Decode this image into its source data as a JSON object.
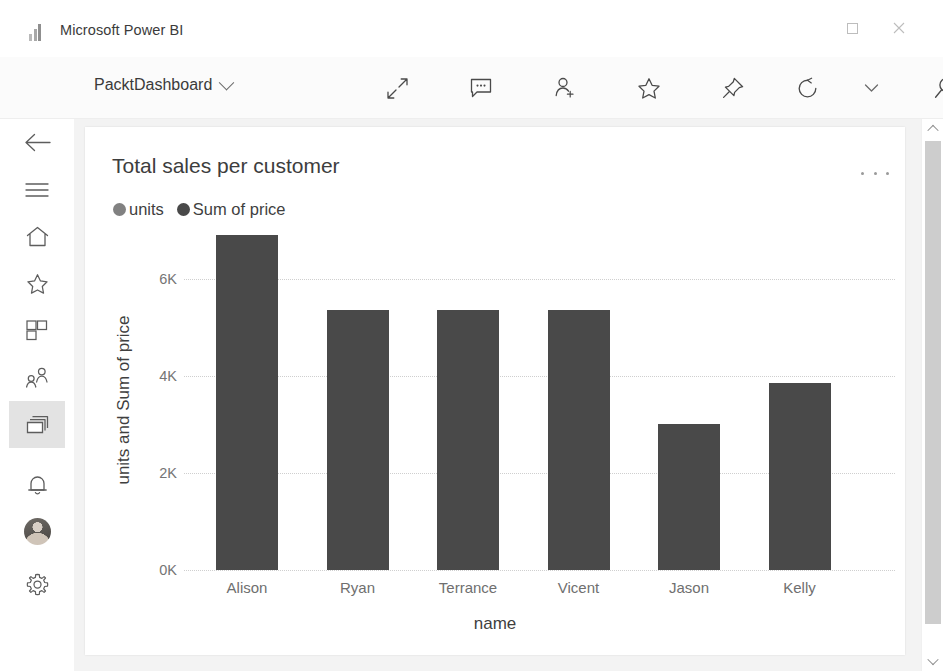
{
  "window": {
    "app_title": "Microsoft Power BI",
    "logo_icon": "power-bi-bars-icon",
    "controls": {
      "minimize": "minimize-icon",
      "maximize": "maximize-icon",
      "close": "close-icon"
    }
  },
  "commandbar": {
    "dashboard_name": "PacktDashboard",
    "dropdown_icon": "chevron-down-icon",
    "actions": [
      {
        "name": "fullscreen-icon",
        "label": "Full screen"
      },
      {
        "name": "comment-icon",
        "label": "Comment"
      },
      {
        "name": "add-person-icon",
        "label": "Share"
      },
      {
        "name": "star-icon",
        "label": "Favorite"
      },
      {
        "name": "pin-icon",
        "label": "Pin"
      },
      {
        "name": "refresh-icon",
        "label": "Refresh"
      },
      {
        "name": "chevron-down-icon",
        "label": "More refresh options"
      },
      {
        "name": "search-icon",
        "label": "Search"
      }
    ]
  },
  "sidebar": {
    "items": [
      {
        "icon": "back-arrow-icon",
        "label": "Back",
        "active": false
      },
      {
        "icon": "hamburger-menu-icon",
        "label": "Menu",
        "active": false
      },
      {
        "icon": "home-icon",
        "label": "Home",
        "active": false
      },
      {
        "icon": "star-icon",
        "label": "Favorites",
        "active": false
      },
      {
        "icon": "apps-grid-icon",
        "label": "Apps",
        "active": false
      },
      {
        "icon": "shared-people-icon",
        "label": "Shared with me",
        "active": false
      },
      {
        "icon": "dashboards-icon",
        "label": "Dashboards",
        "active": true
      },
      {
        "icon": "bell-icon",
        "label": "Notifications",
        "active": false
      },
      {
        "icon": "avatar",
        "label": "Account",
        "active": false
      },
      {
        "icon": "gear-icon",
        "label": "Settings",
        "active": false
      }
    ]
  },
  "card": {
    "title": "Total sales per customer",
    "menu_icon": "more-options-ellipsis-icon"
  },
  "scrollbar": {
    "up_icon": "chevron-up-icon",
    "down_icon": "chevron-down-icon"
  },
  "colors": {
    "bar": "#494949",
    "legend_units": "#818181",
    "legend_sum_of_price": "#494949",
    "canvas": "#f3f3f3",
    "card": "#ffffff",
    "active_rail": "#e3e3e3"
  },
  "chart_data": {
    "type": "bar",
    "title": "Total sales per customer",
    "categories": [
      "Alison",
      "Ryan",
      "Terrance",
      "Vicent",
      "Jason",
      "Kelly"
    ],
    "values": [
      6900,
      5350,
      5350,
      5350,
      3000,
      3850
    ],
    "series": [
      {
        "name": "units",
        "color": "#818181"
      },
      {
        "name": "Sum of price",
        "color": "#494949"
      }
    ],
    "legend": [
      "units",
      "Sum of price"
    ],
    "legend_position": "top-left",
    "xlabel": "name",
    "ylabel": "units and Sum of price",
    "ylim": [
      0,
      7000
    ],
    "yticks": [
      0,
      2000,
      4000,
      6000
    ],
    "ytick_labels": [
      "0K",
      "2K",
      "4K",
      "6K"
    ],
    "grid": true,
    "grid_style": "dotted-horizontal",
    "stacked": true
  }
}
